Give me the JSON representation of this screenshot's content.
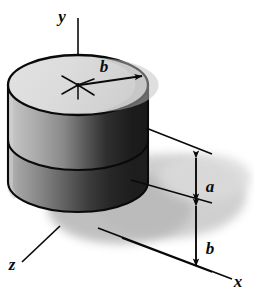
{
  "figure": {
    "background_color": "#ffffff",
    "ink_color": "#0a0a0a"
  },
  "axes": {
    "y": {
      "label": "y",
      "direction": "up",
      "label_x": 62,
      "label_y": 22
    },
    "x": {
      "label": "x",
      "direction": "down-right",
      "label_x": 236,
      "label_y": 285
    },
    "z": {
      "label": "z",
      "direction": "down-left",
      "label_x": 12,
      "label_y": 268
    }
  },
  "dimensions": [
    {
      "name": "radius",
      "label": "b",
      "kind": "radius-arrow",
      "label_x": 104,
      "label_y": 70,
      "description": "radius of the top circular face, arrow from center to rim"
    },
    {
      "name": "upper-height",
      "label": "a",
      "kind": "vertical-dimension",
      "label_x": 208,
      "label_y": 187,
      "description": "height of the cylinder measured on the right dimension line"
    },
    {
      "name": "lower-offset",
      "label": "b",
      "kind": "vertical-dimension",
      "label_x": 208,
      "label_y": 249,
      "description": "distance from the cylinder base down to the x axis"
    }
  ],
  "solid": {
    "name": "cylinder",
    "top_face_fill": "#d8d8d8",
    "body_light_fill": "#b4b4b4",
    "body_dark_fill": "#2a2a2a",
    "shadow_fill": "#c9c9c9",
    "outline_color": "#0a0a0a",
    "bands": 2,
    "center_marker": "starburst"
  }
}
